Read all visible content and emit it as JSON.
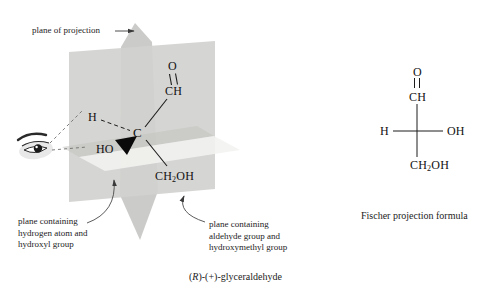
{
  "figure": {
    "plane_of_projection_label": "plane of projection",
    "left_plane_label": [
      "plane containing",
      "hydrogen atom and",
      "hydroxyl group"
    ],
    "right_plane_label": [
      "plane containing",
      "aldehyde group and",
      "hydroxymethyl group"
    ],
    "caption_3d": {
      "pre": "(",
      "stereo": "R",
      "post": ")-(+)-glyceraldehyde"
    },
    "fischer_caption": "Fischer projection formula"
  },
  "molecule_3d": {
    "aldehyde_o": "O",
    "aldehyde_ch": "CH",
    "center_c": "C",
    "hydrogen": "H",
    "hydroxyl": "HO",
    "hydroxymethyl": {
      "main": "CH",
      "sub": "2",
      "tail": "OH"
    }
  },
  "fischer_formula": {
    "aldehyde_o": "O",
    "aldehyde_ch": "CH",
    "hydrogen": "H",
    "hydroxyl": "OH",
    "hydroxymethyl": {
      "main": "CH",
      "sub": "2",
      "tail": "OH"
    }
  },
  "colors": {
    "background": "#ffffff",
    "aldehyde_plane": "#d1d1cf",
    "projection_plane": "#cbcbc9",
    "horizontal_plane_near": "#f2f2f0",
    "horizontal_plane_far": "#c2c2c0",
    "ink": "#1c1c1c"
  }
}
